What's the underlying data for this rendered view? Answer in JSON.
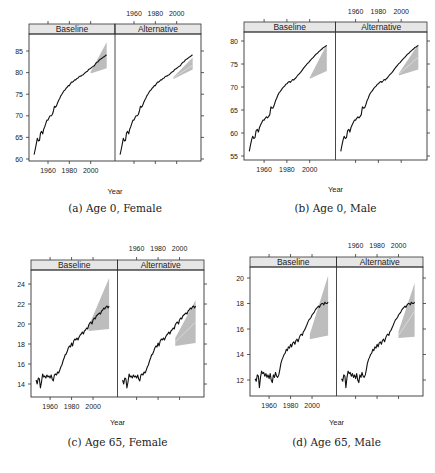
{
  "figure": {
    "strip_fill": "#e6e6e6",
    "band_color": "#bdbdbd",
    "band_inner_color": "#d9d9d9",
    "line_color": "#111111"
  },
  "chart_data": [
    {
      "type": "line",
      "caption": "(a) Age 0, Female",
      "xlabel": "Year",
      "ylabel": "",
      "panels": [
        "Baseline",
        "Alternative"
      ],
      "xlim": [
        1945,
        2020
      ],
      "x_ticks": [
        1960,
        1980,
        2000
      ],
      "ylim": [
        59.5,
        88
      ],
      "y_ticks": [
        60,
        65,
        70,
        75,
        80,
        85
      ],
      "grid": false,
      "observed": {
        "x": [
          1947,
          1948,
          1949,
          1950,
          1951,
          1952,
          1953,
          1954,
          1955,
          1956,
          1957,
          1958,
          1959,
          1960,
          1961,
          1962,
          1963,
          1964,
          1965,
          1966,
          1967,
          1968,
          1969,
          1970,
          1971,
          1972,
          1973,
          1974,
          1975,
          1976,
          1977,
          1978,
          1979,
          1980,
          1981,
          1982,
          1983,
          1984,
          1985,
          1986,
          1987,
          1988,
          1989,
          1990,
          1991,
          1992,
          1993,
          1994,
          1995,
          1996,
          1997,
          1998,
          1999,
          2000,
          2001,
          2002,
          2003,
          2004,
          2005,
          2006,
          2007,
          2008,
          2009,
          2010,
          2011,
          2012,
          2013,
          2014,
          2015
        ],
        "y": [
          61.0,
          62.2,
          63.5,
          64.8,
          64.2,
          64.3,
          66.0,
          66.4,
          65.8,
          66.9,
          67.5,
          68.3,
          69.0,
          69.0,
          69.6,
          70.0,
          70.0,
          70.3,
          71.0,
          72.2,
          72.0,
          72.3,
          73.0,
          73.6,
          74.0,
          74.6,
          75.0,
          75.4,
          75.8,
          76.0,
          76.4,
          76.6,
          77.0,
          77.0,
          77.4,
          77.8,
          77.8,
          78.0,
          78.3,
          78.3,
          78.6,
          78.7,
          79.0,
          79.2,
          79.2,
          79.4,
          79.5,
          79.8,
          80.0,
          80.2,
          80.3,
          80.7,
          80.8,
          81.0,
          81.2,
          81.4,
          81.5,
          81.8,
          82.2,
          82.4,
          82.5,
          82.9,
          83.1,
          83.2,
          83.4,
          83.6,
          83.7,
          84.0,
          84.1
        ]
      },
      "forecast_band": {
        "Baseline": {
          "x": [
            2000,
            2015
          ],
          "lower": [
            79.8,
            81.0
          ],
          "upper": [
            80.2,
            87.0
          ]
        },
        "Alternative": {
          "x": [
            1997,
            2015
          ],
          "lower": [
            78.5,
            80.7
          ],
          "upper": [
            79.0,
            83.5
          ],
          "centre": [
            78.8,
            81.7
          ]
        }
      }
    },
    {
      "type": "line",
      "caption": "(b) Age 0, Male",
      "xlabel": "Year",
      "ylabel": "",
      "panels": [
        "Baseline",
        "Alternative"
      ],
      "xlim": [
        1945,
        2020
      ],
      "x_ticks": [
        1960,
        1980,
        2000
      ],
      "ylim": [
        54.5,
        82
      ],
      "y_ticks": [
        55,
        60,
        65,
        70,
        75,
        80
      ],
      "grid": false,
      "observed": {
        "x": [
          1947,
          1948,
          1949,
          1950,
          1951,
          1952,
          1953,
          1954,
          1955,
          1956,
          1957,
          1958,
          1959,
          1960,
          1961,
          1962,
          1963,
          1964,
          1965,
          1966,
          1967,
          1968,
          1969,
          1970,
          1971,
          1972,
          1973,
          1974,
          1975,
          1976,
          1977,
          1978,
          1979,
          1980,
          1981,
          1982,
          1983,
          1984,
          1985,
          1986,
          1987,
          1988,
          1989,
          1990,
          1991,
          1992,
          1993,
          1994,
          1995,
          1996,
          1997,
          1998,
          1999,
          2000,
          2001,
          2002,
          2003,
          2004,
          2005,
          2006,
          2007,
          2008,
          2009,
          2010,
          2011,
          2012,
          2013,
          2014,
          2015
        ],
        "y": [
          56.0,
          57.3,
          58.5,
          59.3,
          58.8,
          59.0,
          60.5,
          60.8,
          60.2,
          61.2,
          61.8,
          62.3,
          62.8,
          62.8,
          63.2,
          63.5,
          63.3,
          63.6,
          64.0,
          65.7,
          65.4,
          65.5,
          66.2,
          67.0,
          67.5,
          68.2,
          68.7,
          69.0,
          69.3,
          69.7,
          70.0,
          70.2,
          70.6,
          70.7,
          71.0,
          71.2,
          71.0,
          71.3,
          71.6,
          71.5,
          71.8,
          72.0,
          72.4,
          72.7,
          72.9,
          73.2,
          73.5,
          73.9,
          74.2,
          74.5,
          74.8,
          75.1,
          75.3,
          75.6,
          75.9,
          76.2,
          76.4,
          76.7,
          77.0,
          77.2,
          77.4,
          77.7,
          77.9,
          78.1,
          78.3,
          78.6,
          78.7,
          78.9,
          79.0
        ]
      },
      "forecast_band": {
        "Baseline": {
          "x": [
            2000,
            2015
          ],
          "lower": [
            71.8,
            73.5
          ],
          "upper": [
            72.0,
            79.3
          ]
        },
        "Alternative": {
          "x": [
            1998,
            2015
          ],
          "lower": [
            72.5,
            73.8
          ],
          "upper": [
            73.0,
            79.3
          ],
          "centre": [
            72.8,
            76.5
          ]
        }
      }
    },
    {
      "type": "line",
      "caption": "(c) Age 65, Female",
      "xlabel": "Year",
      "ylabel": "",
      "panels": [
        "Baseline",
        "Alternative"
      ],
      "xlim": [
        1945,
        2020
      ],
      "x_ticks": [
        1960,
        1980,
        2000
      ],
      "ylim": [
        13,
        25.5
      ],
      "y_ticks": [
        14,
        16,
        18,
        20,
        22,
        24
      ],
      "grid": false,
      "observed": {
        "x": [
          1947,
          1948,
          1949,
          1950,
          1951,
          1952,
          1953,
          1954,
          1955,
          1956,
          1957,
          1958,
          1959,
          1960,
          1961,
          1962,
          1963,
          1964,
          1965,
          1966,
          1967,
          1968,
          1969,
          1970,
          1971,
          1972,
          1973,
          1974,
          1975,
          1976,
          1977,
          1978,
          1979,
          1980,
          1981,
          1982,
          1983,
          1984,
          1985,
          1986,
          1987,
          1988,
          1989,
          1990,
          1991,
          1992,
          1993,
          1994,
          1995,
          1996,
          1997,
          1998,
          1999,
          2000,
          2001,
          2002,
          2003,
          2004,
          2005,
          2006,
          2007,
          2008,
          2009,
          2010,
          2011,
          2012,
          2013,
          2014,
          2015
        ],
        "y": [
          14.4,
          14.0,
          14.6,
          14.5,
          13.6,
          14.2,
          15.0,
          14.7,
          14.8,
          14.6,
          14.9,
          14.7,
          14.8,
          14.6,
          14.9,
          14.5,
          14.3,
          14.9,
          15.0,
          14.9,
          15.2,
          15.1,
          15.4,
          15.7,
          15.9,
          16.3,
          16.6,
          16.9,
          17.0,
          17.3,
          17.6,
          17.8,
          17.7,
          18.1,
          17.8,
          18.3,
          18.5,
          18.4,
          18.6,
          18.4,
          18.7,
          18.9,
          19.0,
          19.2,
          19.0,
          19.3,
          19.4,
          19.6,
          19.5,
          19.9,
          20.1,
          20.2,
          20.0,
          20.4,
          20.6,
          20.5,
          20.8,
          20.9,
          21.0,
          21.1,
          21.0,
          21.3,
          21.4,
          21.6,
          21.5,
          21.7,
          21.8,
          21.6,
          21.8
        ]
      },
      "forecast_band": {
        "Baseline": {
          "x": [
            1996,
            2015
          ],
          "lower": [
            19.3,
            19.5
          ],
          "upper": [
            19.8,
            24.6
          ]
        },
        "Alternative": {
          "x": [
            1996,
            2015
          ],
          "lower": [
            17.8,
            18.1
          ],
          "upper": [
            18.6,
            22.4
          ],
          "centre": [
            18.2,
            20.2
          ]
        }
      }
    },
    {
      "type": "line",
      "caption": "(d) Age 65, Male",
      "xlabel": "Year",
      "ylabel": "",
      "panels": [
        "Baseline",
        "Alternative"
      ],
      "xlim": [
        1945,
        2020
      ],
      "x_ticks": [
        1960,
        1980,
        2000
      ],
      "ylim": [
        11,
        21
      ],
      "y_ticks": [
        12,
        14,
        16,
        18,
        20
      ],
      "grid": false,
      "observed": {
        "x": [
          1947,
          1948,
          1949,
          1950,
          1951,
          1952,
          1953,
          1954,
          1955,
          1956,
          1957,
          1958,
          1959,
          1960,
          1961,
          1962,
          1963,
          1964,
          1965,
          1966,
          1967,
          1968,
          1969,
          1970,
          1971,
          1972,
          1973,
          1974,
          1975,
          1976,
          1977,
          1978,
          1979,
          1980,
          1981,
          1982,
          1983,
          1984,
          1985,
          1986,
          1987,
          1988,
          1989,
          1990,
          1991,
          1992,
          1993,
          1994,
          1995,
          1996,
          1997,
          1998,
          1999,
          2000,
          2001,
          2002,
          2003,
          2004,
          2005,
          2006,
          2007,
          2008,
          2009,
          2010,
          2011,
          2012,
          2013,
          2014,
          2015
        ],
        "y": [
          12.1,
          11.9,
          12.4,
          12.3,
          11.4,
          12.2,
          12.7,
          12.5,
          12.6,
          12.3,
          12.5,
          12.2,
          12.4,
          12.1,
          12.5,
          12.0,
          11.8,
          12.4,
          12.2,
          12.6,
          12.3,
          12.2,
          12.4,
          12.8,
          13.3,
          13.6,
          13.8,
          14.0,
          14.1,
          14.4,
          14.3,
          14.6,
          14.5,
          14.8,
          14.6,
          14.9,
          15.0,
          14.8,
          15.1,
          15.2,
          15.0,
          15.3,
          15.5,
          15.6,
          15.5,
          15.8,
          15.9,
          16.1,
          16.3,
          16.5,
          16.7,
          16.8,
          16.9,
          17.1,
          17.2,
          17.3,
          17.5,
          17.6,
          17.7,
          17.8,
          17.7,
          17.9,
          18.0,
          18.0,
          17.9,
          18.1,
          18.0,
          18.0,
          18.1
        ]
      },
      "forecast_band": {
        "Baseline": {
          "x": [
            1998,
            2015
          ],
          "lower": [
            15.2,
            15.5
          ],
          "upper": [
            15.6,
            20.2
          ]
        },
        "Alternative": {
          "x": [
            2000,
            2015
          ],
          "lower": [
            15.3,
            15.4
          ],
          "upper": [
            15.8,
            19.6
          ],
          "centre": [
            15.5,
            17.4
          ]
        }
      }
    }
  ]
}
